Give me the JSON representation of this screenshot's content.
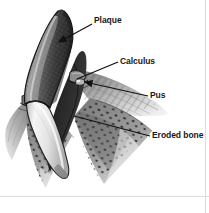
{
  "figure": {
    "style": "grayscale medical line drawing",
    "background_color": "#ffffff",
    "border_color": "#d9d9d9",
    "text_color": "#181818"
  },
  "labels": [
    {
      "id": "plaque",
      "text": "Plaque",
      "text_x": 94,
      "text_y": 16,
      "leader_from_x": 92,
      "leader_from_y": 24,
      "leader_to_x": 57,
      "leader_to_y": 43,
      "arrow": true
    },
    {
      "id": "calculus",
      "text": "Calculus",
      "text_x": 120,
      "text_y": 57,
      "leader_from_x": 118,
      "leader_from_y": 62,
      "leader_to_x": 77,
      "leader_to_y": 79,
      "arrow": false
    },
    {
      "id": "pus",
      "text": "Pus",
      "text_x": 150,
      "text_y": 91,
      "leader_from_x": 148,
      "leader_from_y": 96,
      "leader_to_x": 81,
      "leader_to_y": 82,
      "arrow": true
    },
    {
      "id": "eroded-bone",
      "text": "Eroded bone",
      "text_x": 152,
      "text_y": 131,
      "leader_from_x": 150,
      "leader_from_y": 136,
      "leader_to_x": 74,
      "leader_to_y": 116,
      "arrow": false
    }
  ],
  "anatomy": {
    "tooth_crown": "plaque-covered pointed canine crown",
    "tooth_root": "light enamel / root surface",
    "gum_tissue": "inflamed gingiva, gray shaded",
    "bone": "stippled eroded alveolar bone",
    "crown_dark": "#2b2b2b",
    "crown_mid": "#6e6e6e",
    "crown_light": "#c9c9c9",
    "root_light": "#f2f2f2",
    "gum_gray": "#9a9a9a",
    "bone_gray": "#8c8c8c",
    "outline": "#1a1a1a"
  }
}
